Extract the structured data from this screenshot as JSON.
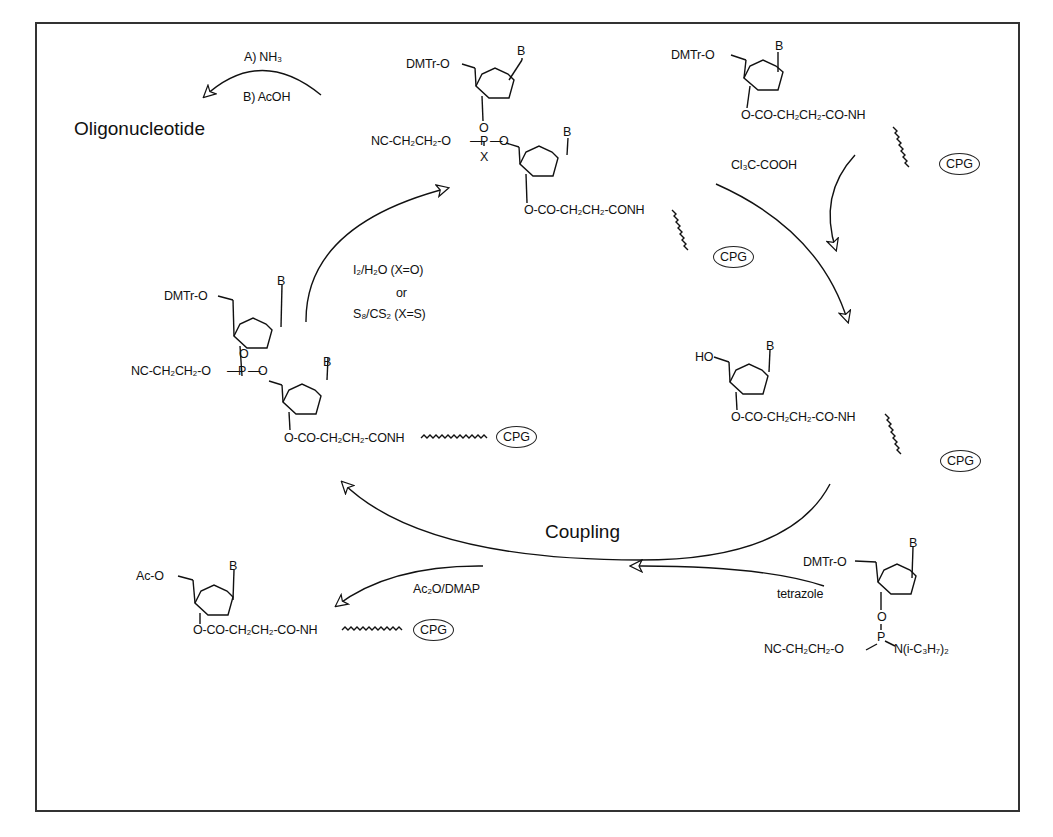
{
  "cycle_label": "Coupling",
  "product": {
    "label": "Oligonucleotide",
    "reagent_step_a": "A) NH₃",
    "reagent_step_b": "B) AcOH"
  },
  "reagents": {
    "detritylation": "Cl₃C-COOH",
    "oxidation_line1": "I₂/H₂O (X=O)",
    "oxidation_or": "or",
    "oxidation_line2": "S₈/CS₂ (X=S)",
    "activator": "tetrazole",
    "capping": "Ac₂O/DMAP"
  },
  "structures": {
    "start": {
      "protecting_group": "DMTr-O",
      "base": "B",
      "linker": "O-CO-CH₂CH₂-CO-NH",
      "support": "CPG"
    },
    "detritylated": {
      "protecting_group": "HO",
      "base": "B",
      "linker": "O-CO-CH₂CH₂-CO-NH",
      "support": "CPG"
    },
    "phosphoramidite": {
      "protecting_group": "DMTr-O",
      "base": "B",
      "o3": "O",
      "p": "P",
      "cyanoethyl": "NC-CH₂CH₂-O",
      "amine": "N(i-C₃H₇)₂"
    },
    "phosphite_triester": {
      "protecting_group": "DMTr-O",
      "base1": "B",
      "base2": "B",
      "o3": "O",
      "p": "P",
      "o5": "O",
      "cyanoethyl": "NC-CH₂CH₂-O",
      "linker": "O-CO-CH₂CH₂-CONH",
      "support": "CPG"
    },
    "phosphate_triester": {
      "protecting_group": "DMTr-O",
      "base1": "B",
      "base2": "B",
      "o3": "O",
      "p": "P",
      "x": "X",
      "o5": "O",
      "cyanoethyl": "NC-CH₂CH₂-O",
      "linker": "O-CO-CH₂CH₂-CONH",
      "support": "CPG"
    },
    "capped": {
      "protecting_group": "Ac-O",
      "base": "B",
      "linker": "O-CO-CH₂CH₂-CO-NH",
      "support": "CPG"
    }
  },
  "colors": {
    "ink": "#111111",
    "frame": "#333333",
    "background": "#ffffff"
  }
}
